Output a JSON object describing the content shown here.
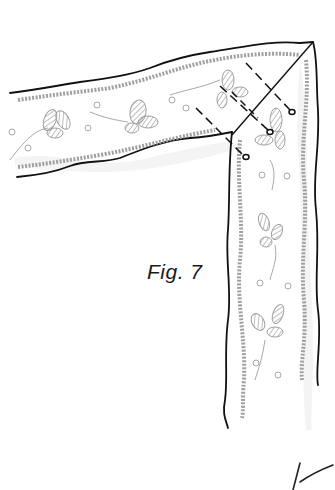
{
  "figure": {
    "caption": "Fig. 7",
    "colors": {
      "outline": "#111111",
      "pencil": "#9a9a9a",
      "paper": "#ffffff"
    },
    "pins": 4
  }
}
